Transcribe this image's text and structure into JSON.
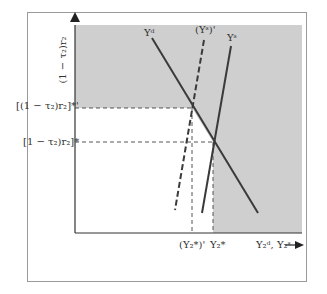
{
  "diagram": {
    "y_axis_label": "(1 − τ₂)r₂",
    "x_axis_label": "Y₂ᵈ, Y₂ˢ",
    "curves": [
      {
        "name": "Yᵈ",
        "style": "solid",
        "label": "Yᵈ"
      },
      {
        "name": "(Yˢ)'",
        "style": "dashed",
        "label": "(Yˢ)'"
      },
      {
        "name": "Yˢ",
        "style": "solid",
        "label": "Yˢ"
      }
    ],
    "y_ticks": [
      {
        "label": "[(1 − τ₂)r₂]*'",
        "position": "upper"
      },
      {
        "label": "[1 − τ₂)r₂]*",
        "position": "lower"
      }
    ],
    "x_ticks": [
      {
        "label": "(Y₂*)'",
        "position": "left"
      },
      {
        "label": "Y₂*",
        "position": "right"
      }
    ],
    "colors": {
      "shade": "#cfcfcf",
      "line": "#3a3a3a",
      "frame": "#9a9a9a"
    }
  }
}
